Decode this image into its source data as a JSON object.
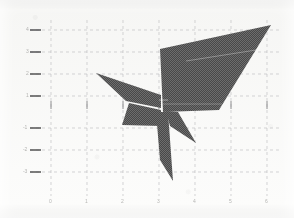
{
  "figure": {
    "kind": "scanned-cartesian-plot",
    "title": "",
    "background_color": "#fdfdfc",
    "ink_color": "#4a4a4a",
    "grid_color": "#b9b9bb",
    "axis_color": "#6e6e70"
  },
  "chart_data": {
    "type": "scatter",
    "title": "",
    "subtitle": "",
    "xlabel": "",
    "ylabel": "",
    "grid": true,
    "legend": null,
    "xlim": [
      -1,
      7
    ],
    "ylim": [
      -4,
      4
    ],
    "x_ticks": [
      "-1",
      "0",
      "1",
      "2",
      "3",
      "4",
      "5",
      "6"
    ],
    "y_ticks": [
      "4",
      "3",
      "2",
      "1",
      "0",
      "-1",
      "-2",
      "-3"
    ],
    "x_tick_px": [
      35,
      51,
      87,
      123,
      159,
      195,
      231,
      267
    ],
    "y_tick_px": [
      30,
      52,
      74,
      96,
      105,
      128,
      150,
      172
    ],
    "annotations": [],
    "series": [
      {
        "name": "shaded-region",
        "kind": "polygon-fill",
        "fill": "#4a4a4a",
        "points_px": [
          [
            160,
            49
          ],
          [
            271,
            25
          ],
          [
            219,
            110
          ],
          [
            163,
            112
          ]
        ]
      },
      {
        "name": "left-upper-wing",
        "kind": "polygon-fill",
        "fill": "#4a4a4a",
        "points_px": [
          [
            96,
            73
          ],
          [
            161,
            95
          ],
          [
            161,
            108
          ],
          [
            126,
            101
          ]
        ]
      },
      {
        "name": "left-lower-wing",
        "kind": "polygon-fill",
        "fill": "#4a4a4a",
        "points_px": [
          [
            129,
            103
          ],
          [
            161,
            110
          ],
          [
            161,
            126
          ],
          [
            122,
            125
          ]
        ]
      },
      {
        "name": "lower-tail",
        "kind": "polygon-fill",
        "fill": "#4a4a4a",
        "points_px": [
          [
            156,
            112
          ],
          [
            168,
            112
          ],
          [
            173,
            181
          ],
          [
            160,
            160
          ]
        ]
      },
      {
        "name": "right-spike",
        "kind": "polygon-fill",
        "fill": "#4a4a4a",
        "points_px": [
          [
            166,
            111
          ],
          [
            178,
            112
          ],
          [
            196,
            143
          ],
          [
            170,
            126
          ]
        ]
      }
    ]
  }
}
